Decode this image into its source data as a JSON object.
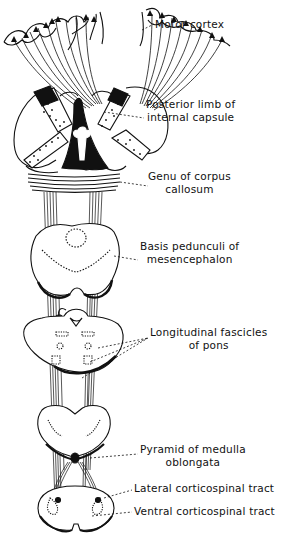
{
  "diagram": {
    "colors": {
      "ink": "#111111",
      "background": "#ffffff"
    },
    "labels": [
      {
        "id": "motor-cortex",
        "lines": [
          "Motor cortex"
        ]
      },
      {
        "id": "posterior-limb-internal-capsule",
        "lines": [
          "Posterior limb of",
          "internal capsule"
        ]
      },
      {
        "id": "genu-corpus-callosum",
        "lines": [
          "Genu of corpus",
          "callosum"
        ]
      },
      {
        "id": "basis-pedunculi",
        "lines": [
          "Basis pedunculi of",
          "mesencephalon"
        ]
      },
      {
        "id": "longitudinal-fascicles-pons",
        "lines": [
          "Longitudinal fascicles",
          "of pons"
        ]
      },
      {
        "id": "pyramid-medulla",
        "lines": [
          "Pyramid of medulla",
          "oblongata"
        ]
      },
      {
        "id": "lateral-corticospinal-tract",
        "lines": [
          "Lateral corticospinal tract"
        ]
      },
      {
        "id": "ventral-corticospinal-tract",
        "lines": [
          "Ventral corticospinal tract"
        ]
      }
    ]
  }
}
